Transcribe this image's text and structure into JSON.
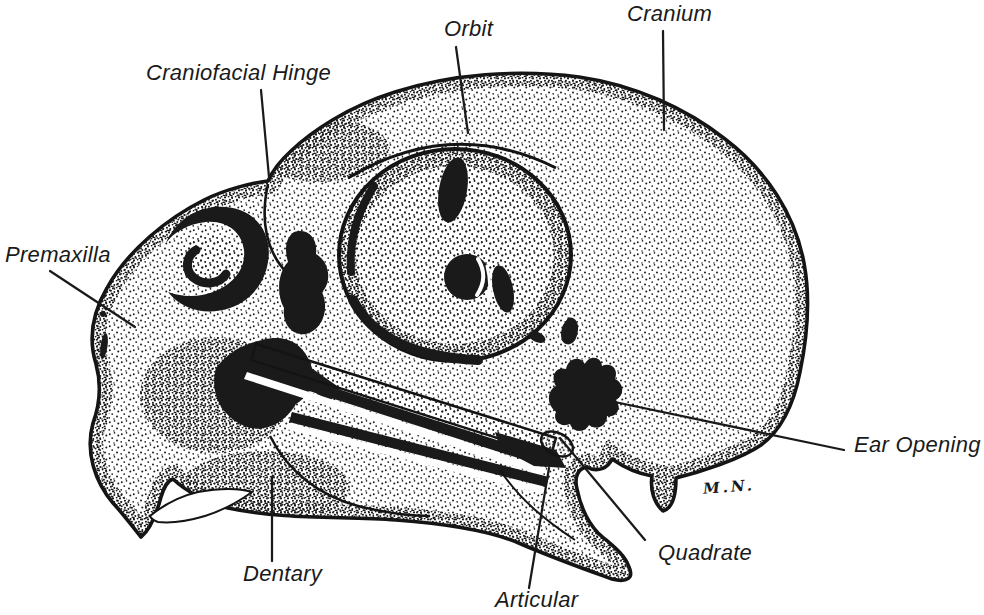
{
  "colors": {
    "ink": "#1a1a1a",
    "background": "#ffffff"
  },
  "labels": {
    "cranium": "Cranium",
    "orbit": "Orbit",
    "craniofacial_hinge": "Craniofacial Hinge",
    "premaxilla": "Premaxilla",
    "ear_opening": "Ear Opening",
    "quadrate": "Quadrate",
    "articular": "Articular",
    "dentary": "Dentary"
  },
  "signature": {
    "text": "M.N."
  }
}
